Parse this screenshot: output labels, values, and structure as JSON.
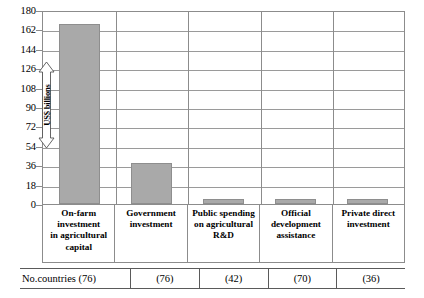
{
  "chart_data": {
    "type": "bar",
    "title": "",
    "subtitle": "",
    "xlabel": "",
    "ylabel": "US$ billions",
    "ylim": [
      0,
      180
    ],
    "yticks": [
      180,
      162,
      144,
      126,
      108,
      90,
      72,
      54,
      36,
      18,
      0
    ],
    "grid": true,
    "legend": "none",
    "bar_color": "#a9a9a9",
    "categories": [
      "On-farm investment in agricultural capital",
      "Government investment",
      "Public spending on agricultural R&D",
      "Official development assistance",
      "Private direct investment"
    ],
    "category_lines": [
      [
        "On-farm",
        "investment",
        "in agricultural",
        "capital"
      ],
      [
        "Government",
        "investment"
      ],
      [
        "Public spending",
        "on agricultural",
        "R&D"
      ],
      [
        "Official",
        "development",
        "assistance"
      ],
      [
        "Private direct",
        "investment"
      ]
    ],
    "values": [
      167,
      38,
      5,
      5,
      5
    ]
  },
  "footer": {
    "row_label": "No.countries (76)",
    "values": [
      "(76)",
      "(42)",
      "(70)",
      "(36)"
    ]
  }
}
